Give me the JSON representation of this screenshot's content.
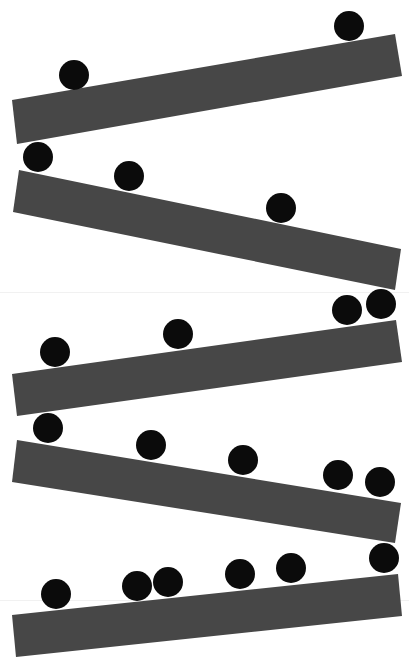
{
  "scene": {
    "width": 409,
    "height": 668,
    "background_color": "#ffffff",
    "ramp_color": "#474747",
    "ball_color": "#0b0b0b",
    "ball_radius": 15,
    "seams": [
      292,
      600
    ],
    "ramps": [
      {
        "id": "ramp-1",
        "points": [
          [
            12,
            100
          ],
          [
            395,
            34
          ],
          [
            402,
            76
          ],
          [
            17,
            144
          ]
        ]
      },
      {
        "id": "ramp-2",
        "points": [
          [
            19,
            170
          ],
          [
            401,
            249
          ],
          [
            395,
            290
          ],
          [
            13,
            212
          ]
        ]
      },
      {
        "id": "ramp-3",
        "points": [
          [
            12,
            374
          ],
          [
            396,
            320
          ],
          [
            402,
            362
          ],
          [
            17,
            416
          ]
        ]
      },
      {
        "id": "ramp-4",
        "points": [
          [
            17,
            440
          ],
          [
            401,
            503
          ],
          [
            395,
            543
          ],
          [
            12,
            482
          ]
        ]
      },
      {
        "id": "ramp-5",
        "points": [
          [
            12,
            615
          ],
          [
            398,
            574
          ],
          [
            402,
            616
          ],
          [
            16,
            657
          ]
        ]
      }
    ],
    "balls": [
      {
        "id": "ball-1",
        "cx": 349,
        "cy": 26
      },
      {
        "id": "ball-2",
        "cx": 74,
        "cy": 75
      },
      {
        "id": "ball-3",
        "cx": 38,
        "cy": 157
      },
      {
        "id": "ball-4",
        "cx": 129,
        "cy": 176
      },
      {
        "id": "ball-5",
        "cx": 281,
        "cy": 208
      },
      {
        "id": "ball-6",
        "cx": 347,
        "cy": 310
      },
      {
        "id": "ball-7",
        "cx": 381,
        "cy": 304
      },
      {
        "id": "ball-8",
        "cx": 178,
        "cy": 334
      },
      {
        "id": "ball-9",
        "cx": 55,
        "cy": 352
      },
      {
        "id": "ball-10",
        "cx": 48,
        "cy": 428
      },
      {
        "id": "ball-11",
        "cx": 151,
        "cy": 445
      },
      {
        "id": "ball-12",
        "cx": 243,
        "cy": 460
      },
      {
        "id": "ball-13",
        "cx": 338,
        "cy": 475
      },
      {
        "id": "ball-14",
        "cx": 380,
        "cy": 482
      },
      {
        "id": "ball-15",
        "cx": 384,
        "cy": 558
      },
      {
        "id": "ball-16",
        "cx": 56,
        "cy": 594
      },
      {
        "id": "ball-17",
        "cx": 137,
        "cy": 586
      },
      {
        "id": "ball-18",
        "cx": 168,
        "cy": 582
      },
      {
        "id": "ball-19",
        "cx": 240,
        "cy": 574
      },
      {
        "id": "ball-20",
        "cx": 291,
        "cy": 568
      }
    ]
  }
}
